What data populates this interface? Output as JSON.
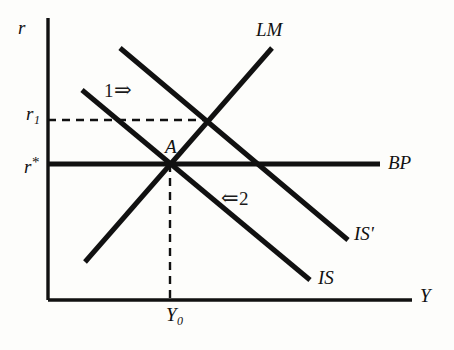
{
  "figure": {
    "type": "economics-diagram",
    "model": "IS-LM-BP",
    "background_color": "#fdfdfb",
    "line_color": "#111111"
  },
  "axes": {
    "y_axis_label": "r",
    "x_axis_label": "Y",
    "y_axis": {
      "x": 48,
      "y_top": 18,
      "y_bottom": 300
    },
    "x_axis": {
      "y": 300,
      "x_left": 48,
      "x_right": 412
    }
  },
  "tick_labels": {
    "r1": {
      "base": "r",
      "subscript": "1",
      "x": 26,
      "y": 104
    },
    "r_star": {
      "base": "r",
      "superscript": "*",
      "x": 24,
      "y": 155
    },
    "Y0": {
      "base": "Y",
      "subscript": "0",
      "x": 166,
      "y": 305
    }
  },
  "curves": [
    {
      "name": "LM",
      "label": "LM",
      "label_x": 256,
      "label_y": 20,
      "x1": 85,
      "y1": 262,
      "x2": 272,
      "y2": 48,
      "stroke_width": 5,
      "dashed": false
    },
    {
      "name": "IS",
      "label": "IS",
      "label_x": 318,
      "label_y": 268,
      "x1": 82,
      "y1": 90,
      "x2": 310,
      "y2": 280,
      "stroke_width": 5,
      "dashed": false
    },
    {
      "name": "IS-prime",
      "label": "IS'",
      "label_x": 354,
      "label_y": 224,
      "x1": 120,
      "y1": 48,
      "x2": 348,
      "y2": 240,
      "stroke_width": 5,
      "dashed": false
    },
    {
      "name": "BP",
      "label": "BP",
      "label_x": 388,
      "label_y": 153,
      "x1": 48,
      "y1": 164,
      "x2": 380,
      "y2": 164,
      "stroke_width": 5,
      "dashed": false
    }
  ],
  "guide_lines": [
    {
      "name": "r1-horizontal-dashed",
      "x1": 48,
      "y1": 120,
      "x2": 207,
      "y2": 120,
      "dashed": true,
      "stroke_width": 2.4
    },
    {
      "name": "Y0-vertical-dashed",
      "x1": 170,
      "y1": 164,
      "x2": 170,
      "y2": 300,
      "dashed": true,
      "stroke_width": 2.4
    }
  ],
  "points": [
    {
      "name": "equilibrium-A",
      "label": "A",
      "x": 170,
      "y": 164,
      "label_x": 165,
      "label_y": 137
    }
  ],
  "annotations": [
    {
      "name": "shift-1",
      "text": "1",
      "arrow": "⇒",
      "arrow_direction": "right",
      "order": "text-then-arrow",
      "x": 104,
      "y": 80
    },
    {
      "name": "shift-2",
      "text": "2",
      "arrow": "⇐",
      "arrow_direction": "left",
      "order": "arrow-then-text",
      "x": 220,
      "y": 188
    }
  ],
  "chart_data": {
    "type": "line",
    "title": "",
    "xlabel": "Y",
    "ylabel": "r",
    "grid": false,
    "legend": "inline-curve-labels",
    "series": [
      {
        "name": "LM",
        "description": "upward sloping money market curve",
        "points": [
          [
            85,
            262
          ],
          [
            272,
            48
          ]
        ]
      },
      {
        "name": "IS",
        "description": "original downward sloping goods market curve",
        "points": [
          [
            82,
            90
          ],
          [
            310,
            280
          ]
        ]
      },
      {
        "name": "IS'",
        "description": "shifted goods market curve",
        "points": [
          [
            120,
            48
          ],
          [
            348,
            240
          ]
        ]
      },
      {
        "name": "BP",
        "description": "horizontal balance of payments curve at r*",
        "points": [
          [
            48,
            164
          ],
          [
            380,
            164
          ]
        ]
      }
    ],
    "marked_levels": {
      "r1": 120,
      "r_star": 164,
      "Y0": 170
    },
    "equilibrium_point": {
      "label": "A",
      "Y": "Y0",
      "r": "r*"
    }
  }
}
